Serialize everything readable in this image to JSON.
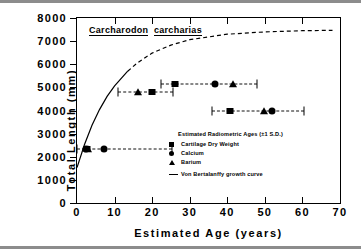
{
  "chart_data": {
    "type": "scatter",
    "xlabel": "Estimated Age (years)",
    "ylabel": "Total Length (mm)",
    "xlim": [
      0,
      70
    ],
    "ylim": [
      0,
      8000
    ],
    "xticks": [
      0,
      10,
      20,
      30,
      40,
      50,
      60,
      70
    ],
    "yticks": [
      0,
      1000,
      2000,
      3000,
      4000,
      5000,
      6000,
      7000,
      8000
    ],
    "grid": false,
    "legend_position": "inside-lower-right",
    "legend_title": "Estimated Radiometric Ages (±1 S.D.)",
    "series": [
      {
        "name": "Cartilage Dry Weight",
        "marker": "square",
        "points": [
          {
            "x": 2.6,
            "y": 2350,
            "xerr_low": 0.0,
            "xerr_high": 25.3
          },
          {
            "x": 20.0,
            "y": 4790,
            "xerr_low": 10.8,
            "xerr_high": 25.6
          },
          {
            "x": 26.0,
            "y": 5150,
            "xerr_low": 22.4,
            "xerr_high": 48.0
          },
          {
            "x": 40.8,
            "y": 3990,
            "xerr_low": 36.0,
            "xerr_high": 60.3
          }
        ]
      },
      {
        "name": "Calcium",
        "marker": "circle",
        "points": [
          {
            "x": 2.3,
            "y": 2350
          },
          {
            "x": 7.2,
            "y": 2350
          },
          {
            "x": 36.6,
            "y": 5150
          },
          {
            "x": 51.8,
            "y": 3990
          }
        ]
      },
      {
        "name": "Barium",
        "marker": "triangle",
        "points": [
          {
            "x": 3.0,
            "y": 2330
          },
          {
            "x": 16.3,
            "y": 4790
          },
          {
            "x": 41.4,
            "y": 5150
          },
          {
            "x": 49.8,
            "y": 3990
          }
        ]
      }
    ],
    "curve": {
      "name": "Von Bertalanffy growth curve",
      "L_inf": 7500,
      "K": 0.095,
      "t0": -3.5,
      "solid_until_age": 13.5,
      "dashed_from_age": 13.5,
      "points": [
        {
          "x": 0,
          "y": 1530
        },
        {
          "x": 2,
          "y": 2530
        },
        {
          "x": 4,
          "y": 3360
        },
        {
          "x": 6,
          "y": 4040
        },
        {
          "x": 8,
          "y": 4610
        },
        {
          "x": 10,
          "y": 5070
        },
        {
          "x": 13.5,
          "y": 5700
        },
        {
          "x": 16,
          "y": 6050
        },
        {
          "x": 20,
          "y": 6480
        },
        {
          "x": 25,
          "y": 6830
        },
        {
          "x": 30,
          "y": 7060
        },
        {
          "x": 40,
          "y": 7300
        },
        {
          "x": 50,
          "y": 7400
        },
        {
          "x": 60,
          "y": 7450
        },
        {
          "x": 68,
          "y": 7470
        }
      ]
    },
    "legend_entries": [
      {
        "label": "Cartilage Dry Weight",
        "marker": "square"
      },
      {
        "label": "Calcium",
        "marker": "circle"
      },
      {
        "label": "Barium",
        "marker": "triangle"
      },
      {
        "label": "Von Bertalanffy growth curve",
        "marker": "line"
      }
    ]
  }
}
